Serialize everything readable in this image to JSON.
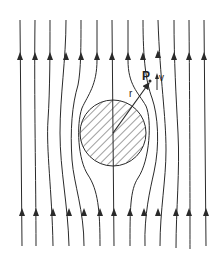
{
  "diagram": {
    "title": "",
    "colors": {
      "line": "#2a2a2a",
      "background": "#ffffff"
    },
    "labels": {
      "point": "P",
      "radius": "r",
      "velocity": "v"
    },
    "obstacle": {
      "shape": "circle",
      "fill": "hatched",
      "cx": 113,
      "cy": 133,
      "r": 33
    },
    "streamlines": {
      "count": 13,
      "direction": "up"
    }
  }
}
